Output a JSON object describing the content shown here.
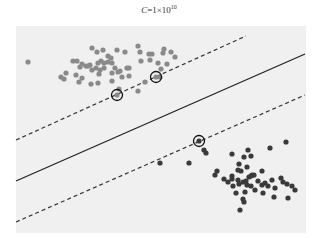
{
  "chart_data": {
    "type": "scatter",
    "title_parts": {
      "var": "C",
      "eq": "=1×10",
      "exp": "10"
    },
    "xlabel": "",
    "ylabel": "",
    "grid": false,
    "legend": null,
    "plot_area": {
      "x": 16,
      "y": 26,
      "width": 290,
      "height": 207,
      "background": "#f0f0f0"
    },
    "series": [
      {
        "name": "class A (grey)",
        "color": "#8a8a8a",
        "points": [
          [
            28,
            62
          ],
          [
            92,
            48
          ],
          [
            97,
            52
          ],
          [
            103,
            50
          ],
          [
            108,
            56
          ],
          [
            111,
            58
          ],
          [
            117,
            50
          ],
          [
            125,
            52
          ],
          [
            138,
            46
          ],
          [
            140,
            52
          ],
          [
            149,
            54
          ],
          [
            152,
            54
          ],
          [
            163,
            53
          ],
          [
            164,
            49
          ],
          [
            171,
            52
          ],
          [
            175,
            57
          ],
          [
            73,
            61
          ],
          [
            77,
            61
          ],
          [
            82,
            64
          ],
          [
            80,
            67
          ],
          [
            86,
            66
          ],
          [
            88,
            66
          ],
          [
            90,
            65
          ],
          [
            92,
            70
          ],
          [
            96,
            68
          ],
          [
            100,
            70
          ],
          [
            99,
            74
          ],
          [
            98,
            63
          ],
          [
            101,
            61
          ],
          [
            104,
            63
          ],
          [
            108,
            62
          ],
          [
            112,
            63
          ],
          [
            115,
            68
          ],
          [
            118,
            72
          ],
          [
            120,
            71
          ],
          [
            104,
            68
          ],
          [
            112,
            73
          ],
          [
            127,
            68
          ],
          [
            129,
            68
          ],
          [
            141,
            61
          ],
          [
            150,
            60
          ],
          [
            158,
            63
          ],
          [
            66,
            73
          ],
          [
            61,
            77
          ],
          [
            64,
            79
          ],
          [
            76,
            75
          ],
          [
            82,
            78
          ],
          [
            79,
            82
          ],
          [
            91,
            84
          ],
          [
            98,
            83
          ],
          [
            112,
            81
          ],
          [
            119,
            89
          ],
          [
            122,
            77
          ],
          [
            129,
            76
          ],
          [
            138,
            91
          ],
          [
            145,
            82
          ],
          [
            161,
            69
          ],
          [
            167,
            64
          ],
          [
            160,
            77
          ]
        ]
      },
      {
        "name": "class B (dark)",
        "color": "#3a3a3a",
        "points": [
          [
            160,
            163
          ],
          [
            189,
            163
          ],
          [
            204,
            150
          ],
          [
            206,
            153
          ],
          [
            232,
            154
          ],
          [
            217,
            171
          ],
          [
            215,
            175
          ],
          [
            233,
            186
          ],
          [
            244,
            157
          ],
          [
            248,
            150
          ],
          [
            251,
            156
          ],
          [
            238,
            170
          ],
          [
            239,
            164
          ],
          [
            232,
            176
          ],
          [
            241,
            171
          ],
          [
            247,
            167
          ],
          [
            251,
            176
          ],
          [
            254,
            175
          ],
          [
            258,
            181
          ],
          [
            232,
            179
          ],
          [
            238,
            180
          ],
          [
            243,
            182
          ],
          [
            246,
            181
          ],
          [
            249,
            177
          ],
          [
            252,
            175
          ],
          [
            239,
            184
          ],
          [
            247,
            185
          ],
          [
            251,
            186
          ],
          [
            262,
            185
          ],
          [
            265,
            183
          ],
          [
            255,
            190
          ],
          [
            245,
            192
          ],
          [
            268,
            186
          ],
          [
            272,
            180
          ],
          [
            275,
            188
          ],
          [
            281,
            178
          ],
          [
            283,
            182
          ],
          [
            287,
            184
          ],
          [
            292,
            186
          ],
          [
            295,
            190
          ],
          [
            262,
            171
          ],
          [
            270,
            148
          ],
          [
            286,
            142
          ],
          [
            224,
            179
          ],
          [
            228,
            182
          ],
          [
            236,
            193
          ],
          [
            243,
            199
          ],
          [
            240,
            210
          ],
          [
            244,
            202
          ],
          [
            263,
            193
          ],
          [
            274,
            197
          ],
          [
            288,
            198
          ]
        ]
      }
    ],
    "support_vectors": [
      {
        "x": 117,
        "y": 95,
        "class": "A"
      },
      {
        "x": 156,
        "y": 77,
        "class": "A"
      },
      {
        "x": 199,
        "y": 141,
        "class": "B"
      }
    ],
    "decision_boundary": {
      "style": "solid",
      "color": "#222222",
      "x1": 16,
      "y1": 181,
      "x2": 305,
      "y2": 54
    },
    "margins": [
      {
        "style": "dashed",
        "color": "#333333",
        "x1": 16,
        "y1": 140,
        "x2": 246,
        "y2": 36
      },
      {
        "style": "dashed",
        "color": "#333333",
        "x1": 16,
        "y1": 222,
        "x2": 305,
        "y2": 95
      }
    ]
  }
}
